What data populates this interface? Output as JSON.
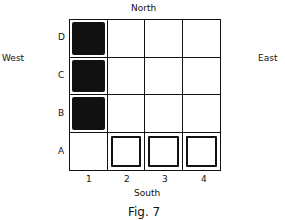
{
  "directions": {
    "north": "North",
    "south": "South",
    "west": "West",
    "east": "East"
  },
  "caption": "Fig. 7",
  "rows": [
    "D",
    "C",
    "B",
    "A"
  ],
  "columns": [
    "1",
    "2",
    "3",
    "4"
  ],
  "cells": {
    "D1": "filled",
    "C1": "filled",
    "B1": "filled",
    "A2": "boxed",
    "A3": "boxed",
    "A4": "boxed"
  }
}
